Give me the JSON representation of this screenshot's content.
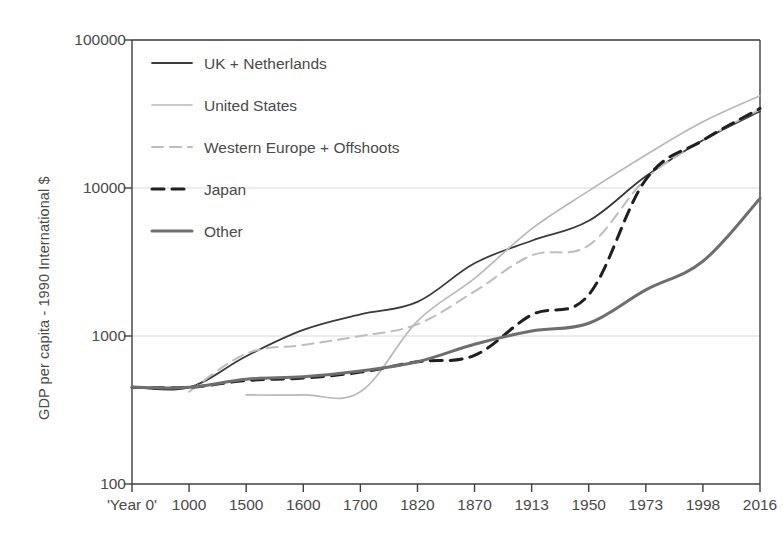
{
  "chart_data": {
    "type": "line",
    "title": "",
    "xlabel": "",
    "ylabel": "GDP per capita - 1990 International $",
    "x_is_categorical": true,
    "categories": [
      "'Year 0'",
      "1000",
      "1500",
      "1600",
      "1700",
      "1820",
      "1870",
      "1913",
      "1950",
      "1973",
      "1998",
      "2016"
    ],
    "yscale": "log",
    "ylim": [
      100,
      100000
    ],
    "yticks": [
      100,
      1000,
      10000,
      100000
    ],
    "ytick_labels": [
      "100",
      "1000",
      "10000",
      "100000"
    ],
    "grid": "horizontal-major",
    "legend_position": "upper-left-inside",
    "series": [
      {
        "name": "UK + Netherlands",
        "style": "solid",
        "color": "#3a3a3a",
        "width": 1.8,
        "values": [
          450,
          450,
          730,
          1100,
          1400,
          1700,
          3100,
          4400,
          6000,
          12000,
          21000,
          33000
        ]
      },
      {
        "name": "United States",
        "style": "solid-thin-light",
        "color": "#b8b8b8",
        "width": 1.7,
        "values": [
          null,
          null,
          400,
          400,
          420,
          1260,
          2450,
          5300,
          9560,
          16700,
          28000,
          42000
        ]
      },
      {
        "name": "Western Europe + Offshoots",
        "style": "dashed",
        "color": "#bdbdbd",
        "width": 2.0,
        "values": [
          null,
          420,
          760,
          870,
          1000,
          1200,
          2000,
          3500,
          4100,
          11500,
          21000,
          34000
        ]
      },
      {
        "name": "Japan",
        "style": "dashed-bold",
        "color": "#1f1f1f",
        "width": 3.0,
        "values": [
          450,
          450,
          500,
          520,
          570,
          670,
          740,
          1390,
          1900,
          11400,
          21000,
          34500
        ]
      },
      {
        "name": "Other",
        "style": "solid-bold",
        "color": "#6e6e6e",
        "width": 3.0,
        "values": [
          450,
          450,
          510,
          530,
          580,
          670,
          880,
          1080,
          1220,
          2050,
          3200,
          8500
        ]
      }
    ]
  },
  "legend": {
    "items": [
      {
        "label": "UK + Netherlands",
        "swatch": "solid"
      },
      {
        "label": "United States",
        "swatch": "solid-thin-light"
      },
      {
        "label": "Western Europe + Offshoots",
        "swatch": "dashed"
      },
      {
        "label": "Japan",
        "swatch": "dashed-bold"
      },
      {
        "label": "Other",
        "swatch": "solid-bold"
      }
    ]
  },
  "axes": {
    "y_title": "GDP per capita - 1990 International $",
    "y_ticks": [
      "100000",
      "10000",
      "1000",
      "100"
    ],
    "x_ticks": [
      "'Year 0'",
      "1000",
      "1500",
      "1600",
      "1700",
      "1820",
      "1870",
      "1913",
      "1950",
      "1973",
      "1998",
      "2016"
    ]
  },
  "colors": {
    "axis": "#3f3f3f",
    "grid": "#d9d9d9",
    "uk": "#3a3a3a",
    "us": "#b8b8b8",
    "we": "#bdbdbd",
    "japan": "#1f1f1f",
    "other": "#6e6e6e"
  }
}
